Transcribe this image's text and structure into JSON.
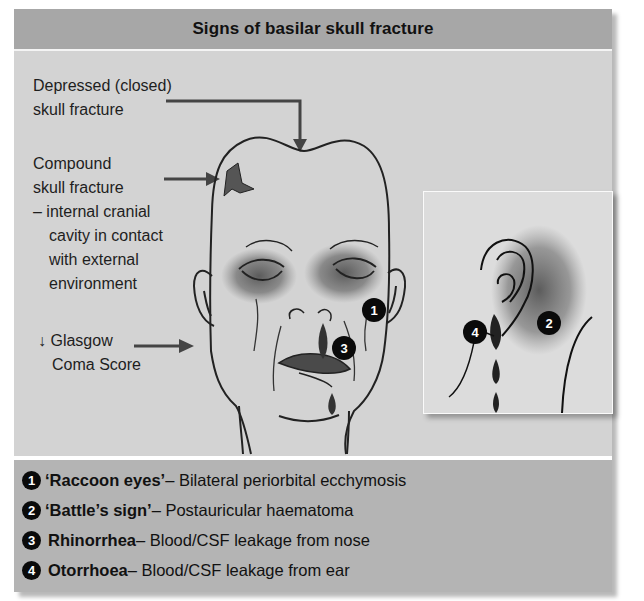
{
  "title": "Signs of basilar skull fracture",
  "labels": {
    "depressed": [
      "Depressed (closed)",
      "skull fracture"
    ],
    "compound": [
      "Compound",
      "skull fracture",
      "– internal cranial",
      "cavity in contact",
      "with external",
      "environment"
    ],
    "gcs": [
      "↓ Glasgow",
      "Coma Score"
    ]
  },
  "markers": {
    "raccoon_eyes": "1",
    "battles_sign": "2",
    "rhinorrhea": "3",
    "otorrhoea": "4"
  },
  "legend": [
    {
      "num": "1",
      "term": "‘Raccoon eyes’",
      "desc": " – Bilateral periorbital ecchymosis"
    },
    {
      "num": "2",
      "term": "‘Battle’s sign’",
      "desc": " – Postauricular haematoma"
    },
    {
      "num": "3",
      "term": "Rhinorrhea",
      "desc": " – Blood/CSF leakage from nose"
    },
    {
      "num": "4",
      "term": "Otorrhoea",
      "desc": " – Blood/CSF leakage from ear"
    }
  ],
  "colors": {
    "header_bg": "#a7a7a7",
    "panel_bg": "#d3d3d3",
    "legend_bg": "#b4b4b4",
    "bruise": "#5a5a5a",
    "marker": "#0a0a0a"
  }
}
